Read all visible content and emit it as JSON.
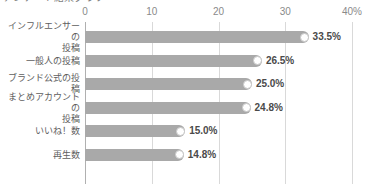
{
  "title_sliver": "アンケート結果グラフ",
  "chart_data": {
    "type": "bar",
    "orientation": "horizontal",
    "title": "",
    "xlabel": "",
    "ylabel": "",
    "xlim": [
      0,
      40
    ],
    "grid": true,
    "legend": false,
    "bar_color": "#a9a9a9",
    "grid_color": "#d9d9d9",
    "axis_color": "#b0b0b0",
    "label_color": "#5e5e5e",
    "value_color": "#4a4a4a",
    "tick_color": "#8a8a8a",
    "ticks": [
      {
        "value": 0,
        "label": "0"
      },
      {
        "value": 10,
        "label": "10"
      },
      {
        "value": 20,
        "label": "20"
      },
      {
        "value": 30,
        "label": "30"
      },
      {
        "value": 40,
        "label": "40%"
      }
    ],
    "categories": [
      "インフルエンサーの\n投稿",
      "一般人の投稿",
      "ブランド公式の投稿",
      "まとめアカウントの\n投稿",
      "いいね！数",
      "再生数"
    ],
    "values": [
      33.5,
      26.5,
      25.0,
      24.8,
      15.0,
      14.8
    ],
    "value_labels": [
      "33.5%",
      "26.5%",
      "25.0%",
      "24.8%",
      "15.0%",
      "14.8%"
    ]
  }
}
